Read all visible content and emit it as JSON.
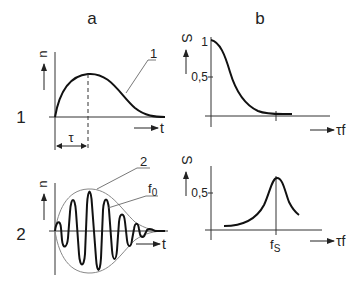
{
  "columns": {
    "a": "a",
    "b": "b"
  },
  "rows": {
    "row1": "1",
    "row2": "2"
  },
  "panel_a1": {
    "y_label": "u",
    "x_label": "t",
    "curve_label": "1",
    "width_label": "τ"
  },
  "panel_a2": {
    "y_label": "u",
    "x_label": "t",
    "envelope_label": "2",
    "carrier_label": "f",
    "carrier_sub": "0"
  },
  "panel_b1": {
    "y_label": "S",
    "x_label": "τf",
    "tick_1": "1",
    "tick_05": "0,5"
  },
  "panel_b2": {
    "y_label": "S",
    "x_label": "τf",
    "tick_05": "0,5",
    "peak_label": "f",
    "peak_sub": "S"
  },
  "colors": {
    "ink": "#222222",
    "envelope": "#888888",
    "background": "#ffffff"
  }
}
